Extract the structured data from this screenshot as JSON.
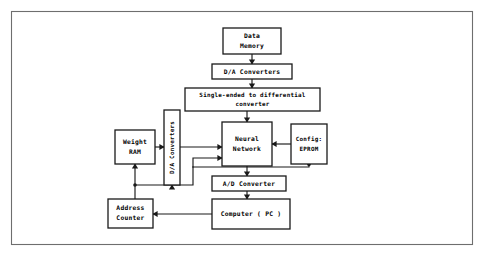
{
  "figure": {
    "kind": "block-diagram",
    "frame": {
      "stroke_color": "#6e6e6e",
      "fill_color": "#ffffff"
    },
    "line_color": "#1a1a1a",
    "box_fill": "#ffffff"
  },
  "nodes": [
    {
      "id": "data-memory",
      "lines": [
        "Data",
        "Memory"
      ],
      "line1": "Data",
      "line2": "Memory",
      "orientation": "horizontal",
      "x": 223,
      "y": 28,
      "w": 58,
      "h": 26
    },
    {
      "id": "da-converters-top",
      "lines": [
        "D/A Converters"
      ],
      "line1": "D/A Converters",
      "orientation": "horizontal",
      "x": 212,
      "y": 64,
      "w": 80,
      "h": 15
    },
    {
      "id": "single-ended-converter",
      "lines": [
        "Single-ended to differential",
        "converter"
      ],
      "line1": "Single-ended to differential",
      "line2": "converter",
      "orientation": "horizontal",
      "x": 185,
      "y": 88,
      "w": 135,
      "h": 23
    },
    {
      "id": "neural-network",
      "lines": [
        "Neural",
        "Network"
      ],
      "line1": "Neural",
      "line2": "Network",
      "orientation": "horizontal",
      "x": 222,
      "y": 122,
      "w": 50,
      "h": 44
    },
    {
      "id": "config-eprom",
      "lines": [
        "Config:",
        "EPROM"
      ],
      "line1": "Config:",
      "line2": "EPROM",
      "orientation": "horizontal",
      "x": 291,
      "y": 124,
      "w": 36,
      "h": 40
    },
    {
      "id": "weight-ram",
      "lines": [
        "Weight",
        "RAM"
      ],
      "line1": "Weight",
      "line2": "RAM",
      "orientation": "horizontal",
      "x": 115,
      "y": 130,
      "w": 40,
      "h": 34
    },
    {
      "id": "da-converters-vertical",
      "lines": [
        "D/A Converters"
      ],
      "line1": "D/A Converters",
      "orientation": "vertical",
      "x": 164,
      "y": 110,
      "w": 16,
      "h": 75
    },
    {
      "id": "ad-converter",
      "lines": [
        "A/D Converter"
      ],
      "line1": "A/D Converter",
      "orientation": "horizontal",
      "x": 212,
      "y": 176,
      "w": 74,
      "h": 15
    },
    {
      "id": "address-counter",
      "lines": [
        "Address",
        "Counter"
      ],
      "line1": "Address",
      "line2": "Counter",
      "orientation": "horizontal",
      "x": 108,
      "y": 199,
      "w": 45,
      "h": 29
    },
    {
      "id": "computer-pc",
      "lines": [
        "Computer ( PC )"
      ],
      "line1": "Computer ( PC )",
      "orientation": "horizontal",
      "x": 212,
      "y": 199,
      "w": 78,
      "h": 30
    }
  ],
  "connections": [
    {
      "id": "data-memory-to-da",
      "from": "data-memory",
      "to": "da-converters-top",
      "direction": "down"
    },
    {
      "id": "da-to-single-ended",
      "from": "da-converters-top",
      "to": "single-ended-converter",
      "direction": "down"
    },
    {
      "id": "single-ended-to-nn",
      "from": "single-ended-converter",
      "to": "neural-network",
      "direction": "down"
    },
    {
      "id": "weight-ram-to-da-vertical",
      "from": "weight-ram",
      "to": "da-converters-vertical",
      "direction": "right"
    },
    {
      "id": "da-vertical-to-nn",
      "from": "da-converters-vertical",
      "to": "neural-network",
      "direction": "right"
    },
    {
      "id": "config-eprom-to-nn",
      "from": "config-eprom",
      "to": "neural-network",
      "direction": "left"
    },
    {
      "id": "config-eprom-to-nn-lower",
      "from": "config-eprom",
      "to": "neural-network",
      "direction": "left-lower"
    },
    {
      "id": "nn-to-ad-converter",
      "from": "neural-network",
      "to": "ad-converter",
      "direction": "down"
    },
    {
      "id": "ad-converter-to-computer",
      "from": "ad-converter",
      "to": "computer-pc",
      "direction": "down"
    },
    {
      "id": "computer-to-address-counter",
      "from": "computer-pc",
      "to": "address-counter",
      "direction": "left"
    },
    {
      "id": "address-counter-to-weight-ram",
      "from": "address-counter",
      "to": "weight-ram",
      "direction": "up"
    },
    {
      "id": "address-counter-bus-to-da-vertical",
      "from": "address-counter",
      "to": "da-converters-vertical",
      "direction": "up-right"
    }
  ]
}
